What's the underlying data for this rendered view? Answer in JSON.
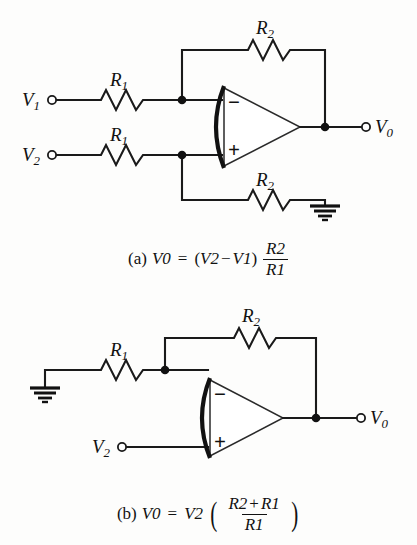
{
  "figure": {
    "type": "electronic-circuit-schematic",
    "background_color": "#fdfdfc",
    "line_color": "#111111"
  },
  "circuits": [
    {
      "id": "a",
      "name": "difference-amplifier",
      "inputs": [
        {
          "label": "V",
          "sub": "1",
          "terminal": "open-circle"
        },
        {
          "label": "V",
          "sub": "2",
          "terminal": "open-circle"
        }
      ],
      "output": {
        "label": "V",
        "sub": "0",
        "terminal": "open-circle"
      },
      "resistors": [
        {
          "label": "R",
          "sub": "1",
          "position": "top-input-series"
        },
        {
          "label": "R",
          "sub": "1",
          "position": "bottom-input-series"
        },
        {
          "label": "R",
          "sub": "2",
          "position": "feedback-top"
        },
        {
          "label": "R",
          "sub": "2",
          "position": "noninverting-to-ground"
        }
      ],
      "opamp": {
        "inverting_sign": "−",
        "noninverting_sign": "+",
        "inverting_input": "top",
        "noninverting_input": "bottom"
      },
      "ground_symbols": 1,
      "junction_dots": 3,
      "caption": {
        "tag": "(a)",
        "lhs": "V",
        "lhs_sub": "0",
        "equals": "=",
        "group": "(V₂ − V₁)",
        "group_open": "(",
        "group_close": ")",
        "group_term1": "V",
        "group_term1_sub": "2",
        "group_minus": "−",
        "group_term2": "V",
        "group_term2_sub": "1",
        "frac_num": "R",
        "frac_num_sub": "2",
        "frac_den": "R",
        "frac_den_sub": "1",
        "plain_text": "(a)  V0 = (V2 − V1) R2/R1"
      }
    },
    {
      "id": "b",
      "name": "noninverting-amplifier",
      "inputs": [
        {
          "label": "V",
          "sub": "2",
          "terminal": "open-circle"
        }
      ],
      "output": {
        "label": "V",
        "sub": "0",
        "terminal": "open-circle"
      },
      "resistors": [
        {
          "label": "R",
          "sub": "1",
          "position": "inverting-to-ground"
        },
        {
          "label": "R",
          "sub": "2",
          "position": "feedback-top"
        }
      ],
      "opamp": {
        "inverting_sign": "−",
        "noninverting_sign": "+",
        "inverting_input": "top",
        "noninverting_input": "bottom"
      },
      "ground_symbols": 1,
      "junction_dots": 2,
      "caption": {
        "tag": "(b)",
        "lhs": "V",
        "lhs_sub": "0",
        "equals": "=",
        "mult": "V",
        "mult_sub": "2",
        "paren_open": "(",
        "paren_close": ")",
        "frac_num_term1": "R",
        "frac_num_term1_sub": "2",
        "frac_num_plus": "+",
        "frac_num_term2": "R",
        "frac_num_term2_sub": "1",
        "frac_den": "R",
        "frac_den_sub": "1",
        "plain_text": "(b)  V0 = V2 ( (R2 + R1) / R1 )"
      }
    }
  ],
  "labels_a": {
    "v1": {
      "base": "V",
      "sub": "1"
    },
    "v2": {
      "base": "V",
      "sub": "2"
    },
    "v0": {
      "base": "V",
      "sub": "0"
    },
    "r1_top": {
      "base": "R",
      "sub": "1"
    },
    "r1_bottom": {
      "base": "R",
      "sub": "1"
    },
    "r2_top": {
      "base": "R",
      "sub": "2"
    },
    "r2_bottom": {
      "base": "R",
      "sub": "2"
    },
    "minus": "−",
    "plus": "+"
  },
  "labels_b": {
    "v2": {
      "base": "V",
      "sub": "2"
    },
    "v0": {
      "base": "V",
      "sub": "0"
    },
    "r1": {
      "base": "R",
      "sub": "1"
    },
    "r2": {
      "base": "R",
      "sub": "2"
    },
    "minus": "−",
    "plus": "+"
  }
}
